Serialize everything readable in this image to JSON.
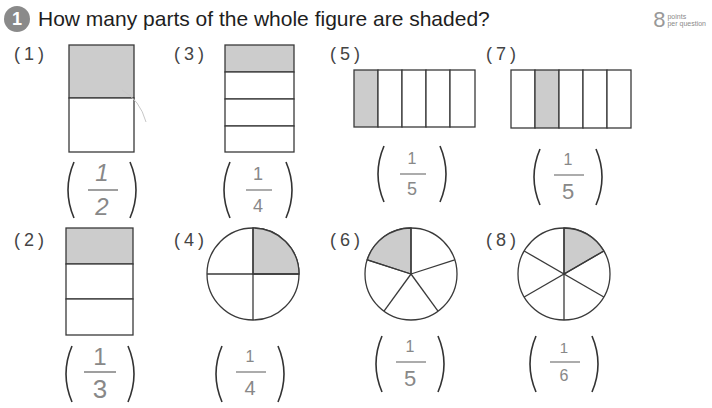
{
  "question": {
    "number": "1",
    "text": "How many parts of the whole figure are shaded?",
    "points_value": "8",
    "points_label_line1": "points",
    "points_label_line2": "per question"
  },
  "colors": {
    "shade": "#cccccc",
    "line": "#333333",
    "answer_ink": "#888888",
    "badge": "#8a8a8a"
  },
  "problems": [
    {
      "label": "(1)",
      "shape": "rectangle",
      "parts": 2,
      "orientation": "rows",
      "shaded_index": 0,
      "answer_num": "1",
      "answer_den": "2"
    },
    {
      "label": "(2)",
      "shape": "rectangle",
      "parts": 3,
      "orientation": "rows",
      "shaded_index": 0,
      "answer_num": "1",
      "answer_den": "3"
    },
    {
      "label": "(3)",
      "shape": "rectangle",
      "parts": 4,
      "orientation": "rows",
      "shaded_index": 0,
      "answer_num": "1",
      "answer_den": "4"
    },
    {
      "label": "(4)",
      "shape": "circle",
      "parts": 4,
      "shaded_index": 0,
      "answer_num": "1",
      "answer_den": "4"
    },
    {
      "label": "(5)",
      "shape": "rectangle",
      "parts": 5,
      "orientation": "columns",
      "shaded_index": 0,
      "answer_num": "1",
      "answer_den": "5"
    },
    {
      "label": "(6)",
      "shape": "circle",
      "parts": 5,
      "shaded_index": 4,
      "answer_num": "1",
      "answer_den": "5"
    },
    {
      "label": "(7)",
      "shape": "rectangle",
      "parts": 5,
      "orientation": "columns",
      "shaded_index": 1,
      "answer_num": "1",
      "answer_den": "5"
    },
    {
      "label": "(8)",
      "shape": "circle",
      "parts": 6,
      "shaded_index": 0,
      "answer_num": "1",
      "answer_den": "6"
    }
  ]
}
